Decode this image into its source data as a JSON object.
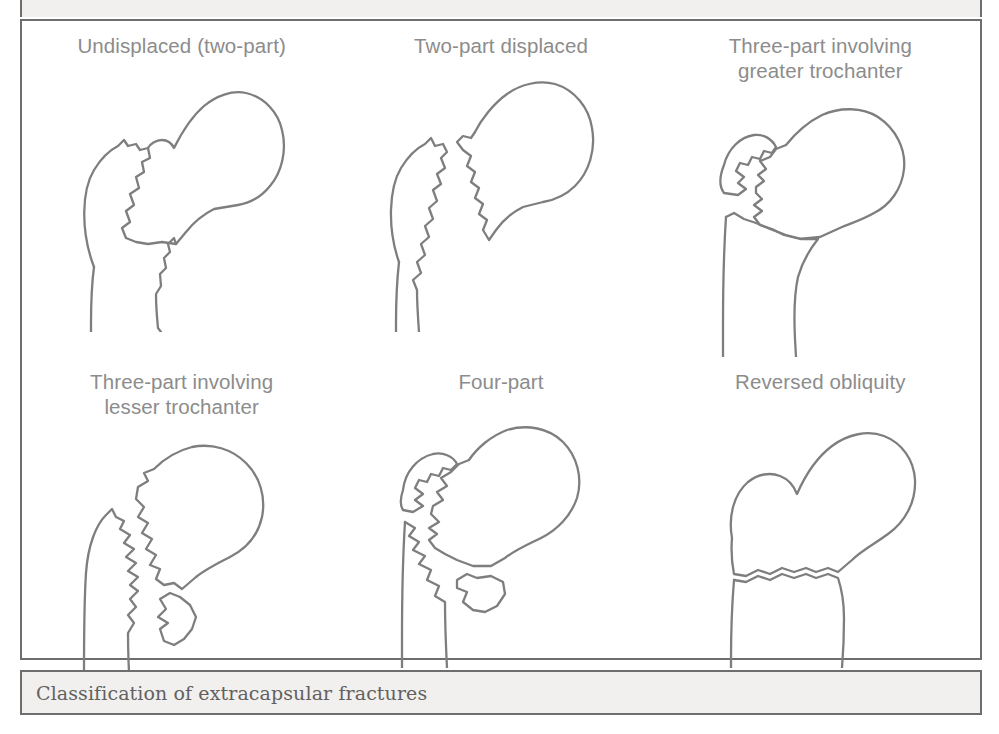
{
  "figure": {
    "caption": "Classification of extracapsular fractures",
    "top_sliver_partial_text": "",
    "panel_border_color": "#6e6e6e",
    "label_color": "#8c8c8c",
    "line_color": "#7e7e7e",
    "caption_band_color": "#f1f0ee",
    "background_color": "#ffffff",
    "cells": [
      {
        "label": "Undisplaced (two-part)",
        "icon": "femur-undisplaced-two-part-icon",
        "fragments": 2,
        "displaced": false,
        "description": "Proximal femur with undisplaced zigzag intertrochanteric fracture line"
      },
      {
        "label": "Two-part displaced",
        "icon": "femur-two-part-displaced-icon",
        "fragments": 2,
        "displaced": true,
        "description": "Proximal femur with displaced two-part intertrochanteric fracture, fragments offset"
      },
      {
        "label": "Three-part involving\ngreater trochanter",
        "icon": "femur-three-part-greater-trochanter-icon",
        "fragments": 3,
        "displaced": true,
        "description": "Greater trochanter separated as a third fragment above the intertrochanteric fracture"
      },
      {
        "label": "Three-part involving\nlesser trochanter",
        "icon": "femur-three-part-lesser-trochanter-icon",
        "fragments": 3,
        "displaced": true,
        "description": "Lesser trochanter separated as a third fragment medially below the fracture"
      },
      {
        "label": "Four-part",
        "icon": "femur-four-part-icon",
        "fragments": 4,
        "displaced": true,
        "description": "Both greater and lesser trochanters separated as individual fragments"
      },
      {
        "label": "Reversed obliquity",
        "icon": "femur-reversed-obliquity-icon",
        "fragments": 2,
        "displaced": false,
        "description": "Fracture line running from distal-lateral to proximal-medial, reversed obliquity pattern"
      }
    ]
  }
}
